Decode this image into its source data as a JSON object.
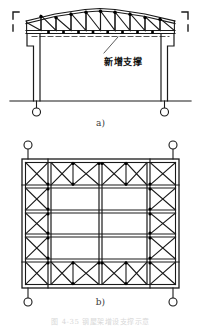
{
  "drawing": {
    "title_caption": "图 4-35  钢屋架增设支撑示意",
    "annotations": {
      "new_bracing_label": "新增支撑",
      "new_bracing_label_name": "newly-added-bracing"
    },
    "subfigures": [
      {
        "id": "a",
        "caption": "a)",
        "view": "elevation",
        "description": "Pitched steel roof truss on two columns with pin supports; dashed line indicates newly added bracing at bottom chord level."
      },
      {
        "id": "b",
        "caption": "b)",
        "view": "plan",
        "description": "Plan view of roof bracing layout with X-braced perimeter bands and open central bays."
      }
    ],
    "geometry_a": {
      "span_left_x": 26,
      "span_right_x": 175,
      "top_chord_apex_y": 9,
      "top_chord_eave_y": 19,
      "bottom_chord_y": 33,
      "bracing_dash_y": 35,
      "ground_line_y": 101,
      "column_left_x": 33,
      "column_right_x": 168,
      "support_circle_radius": 4,
      "panel_count": 10,
      "section_marker": "section-cut-bracket"
    },
    "geometry_b": {
      "frame_left_x": 22,
      "frame_right_x": 179,
      "frame_top_y": 159,
      "frame_bottom_y": 288,
      "corner_circle_radius": 4,
      "brace_bands": [
        "top",
        "bottom",
        "left",
        "right"
      ],
      "bay_columns": 7,
      "bay_rows": 5
    },
    "colors": {
      "line": "#1a1a1a",
      "node": "#000000",
      "dashed": "#555555",
      "background": "#ffffff",
      "caption": "#3a3a3a"
    }
  }
}
